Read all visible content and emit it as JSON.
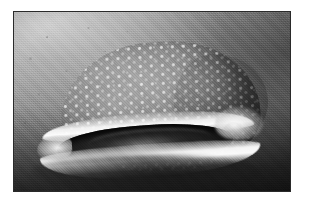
{
  "image": {
    "kind": "photograph",
    "color_mode": "grayscale",
    "subject": "whale-shark-head-frontal",
    "caption": "Frontal view of a whale shark with its wide mouth open, spotted head above, underwater.",
    "frame": {
      "canvas_width": 309,
      "canvas_height": 201,
      "margin_color": "#ffffff",
      "border_color": "#2a2a2a",
      "photo_left": 13,
      "photo_top": 11,
      "photo_width": 278,
      "photo_height": 181
    },
    "palette": {
      "water_light": "#b9b9b9",
      "water_mid": "#8a8a8a",
      "water_dark": "#2a2a2a",
      "body_mid": "#8f8f8f",
      "body_shadow": "#4e4e4e",
      "spot_white": "#eeeeee",
      "lip_white": "#ffffff",
      "mouth_black": "#0c0c0c"
    },
    "regions": {
      "background": "underwater-gradient",
      "head": "spotted-whale-shark-head",
      "mouth": "open-mouth-with-white-lips"
    }
  }
}
